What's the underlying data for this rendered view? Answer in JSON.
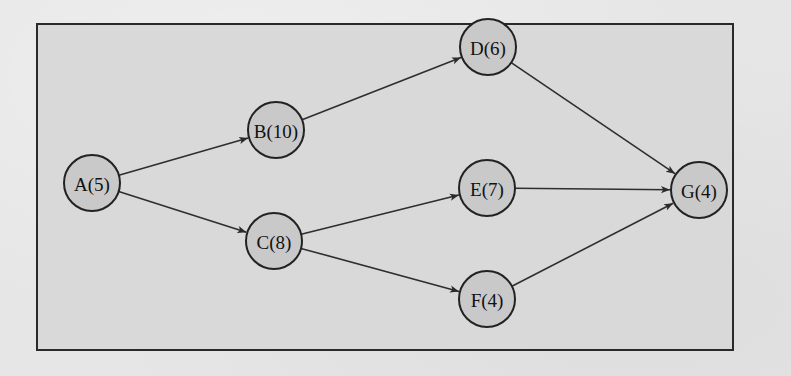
{
  "diagram": {
    "type": "activity-network",
    "frame": {
      "x": 37,
      "y": 24,
      "width": 696,
      "height": 326
    },
    "colors": {
      "background": "#e6e6e6",
      "frame_fill": "#d9d9d9",
      "node_fill": "#c9c9c9",
      "stroke": "#222222"
    },
    "node_radius": 28,
    "nodes": [
      {
        "id": "A",
        "label": "A(5)",
        "duration": 5,
        "x": 92,
        "y": 183
      },
      {
        "id": "B",
        "label": "B(10)",
        "duration": 10,
        "x": 276,
        "y": 130
      },
      {
        "id": "C",
        "label": "C(8)",
        "duration": 8,
        "x": 274,
        "y": 241
      },
      {
        "id": "D",
        "label": "D(6)",
        "duration": 6,
        "x": 488,
        "y": 47
      },
      {
        "id": "E",
        "label": "E(7)",
        "duration": 7,
        "x": 487,
        "y": 188
      },
      {
        "id": "F",
        "label": "F(4)",
        "duration": 4,
        "x": 487,
        "y": 299
      },
      {
        "id": "G",
        "label": "G(4)",
        "duration": 4,
        "x": 699,
        "y": 190
      }
    ],
    "edges": [
      {
        "from": "A",
        "to": "B"
      },
      {
        "from": "A",
        "to": "C"
      },
      {
        "from": "B",
        "to": "D"
      },
      {
        "from": "C",
        "to": "E"
      },
      {
        "from": "C",
        "to": "F"
      },
      {
        "from": "D",
        "to": "G"
      },
      {
        "from": "E",
        "to": "G"
      },
      {
        "from": "F",
        "to": "G"
      }
    ]
  }
}
